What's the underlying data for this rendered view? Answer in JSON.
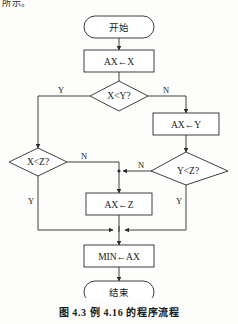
{
  "page": {
    "body_text_fragment": "所示。",
    "caption": "图 4.3   例 4.16 的程序流程"
  },
  "colors": {
    "stroke": "#2a2a2a",
    "shape_fill": "#ffffff",
    "page_background": "#fdfdfc",
    "text": "#1a1a1a"
  },
  "flowchart": {
    "title": "例 4.16 的程序流程",
    "nodes": {
      "start": {
        "label": "开始",
        "type": "terminator"
      },
      "assign_ax_x": {
        "label": "AX←X",
        "type": "process"
      },
      "decide_x_lt_y": {
        "label": "X<Y?",
        "type": "decision"
      },
      "assign_ax_y": {
        "label": "AX←Y",
        "type": "process"
      },
      "decide_x_lt_z": {
        "label": "X<Z?",
        "type": "decision"
      },
      "decide_y_lt_z": {
        "label": "Y<Z?",
        "type": "decision"
      },
      "assign_ax_z": {
        "label": "AX←Z",
        "type": "process"
      },
      "assign_min_ax": {
        "label": "MIN←AX",
        "type": "process"
      },
      "end": {
        "label": "结束",
        "type": "terminator"
      }
    },
    "branch_labels": {
      "x_lt_y_yes": "Y",
      "x_lt_y_no": "N",
      "x_lt_z_no": "N",
      "x_lt_z_yes": "Y",
      "y_lt_z_no": "N",
      "y_lt_z_yes": "Y"
    }
  }
}
